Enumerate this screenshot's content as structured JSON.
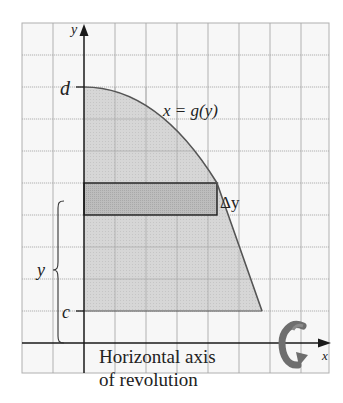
{
  "diagram": {
    "type": "solid-of-revolution-disk-method",
    "axes": {
      "x_label": "x",
      "y_label": "y"
    },
    "tick_labels": {
      "top_bound": "d",
      "bottom_bound": "c"
    },
    "curve_label": "x = g(y)",
    "strip_label": "Δy",
    "brace_label": "y",
    "caption_line1": "Horizontal axis",
    "caption_line2": "of revolution",
    "rotation_icon": "revolution-arrow-icon",
    "colors": {
      "region_fill": "#cfcfcf",
      "strip_fill": "#b9b9b9",
      "grid": "#a8a8a8",
      "axis": "#1a1a1a",
      "curve": "#555555",
      "arrow": "#7a7a7a"
    }
  }
}
